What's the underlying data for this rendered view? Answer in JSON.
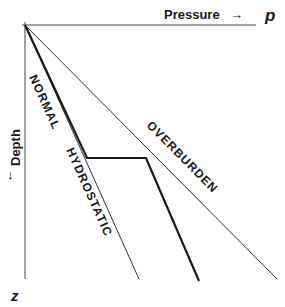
{
  "diagram": {
    "x_axis": {
      "label": "Pressure",
      "arrow": "→",
      "symbol": "p"
    },
    "y_axis": {
      "label": "Depth",
      "arrow": "↓",
      "symbol": "z"
    },
    "lines": [
      {
        "name": "NORMAL HYDROSTATIC",
        "label_part1": "NORMAL",
        "label_part2": "HYDROSTATIC"
      },
      {
        "name": "OVERBURDEN",
        "label": "OVERBURDEN"
      },
      {
        "name": "abnormal-pressure-profile",
        "label": ""
      }
    ],
    "colors": {
      "line": "#1a1a1a",
      "thin_line": "#333333",
      "background": "#ffffff"
    }
  }
}
